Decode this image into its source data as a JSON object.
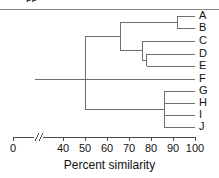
{
  "figure": {
    "clipped_caption_fragment": "pp",
    "axis_title": "Percent similarity",
    "axis_break_marker": "//",
    "line_color": "#6e6e6e",
    "text_color": "#111111",
    "background": "#ffffff"
  },
  "leaves": [
    {
      "label": "A",
      "y": 16,
      "merge_similarity": 92
    },
    {
      "label": "B",
      "y": 28,
      "merge_similarity": 92
    },
    {
      "label": "C",
      "y": 41,
      "merge_similarity": 76
    },
    {
      "label": "D",
      "y": 54,
      "merge_similarity": 78
    },
    {
      "label": "E",
      "y": 66,
      "merge_similarity": 78
    },
    {
      "label": "F",
      "y": 79,
      "merge_similarity": 50
    },
    {
      "label": "G",
      "y": 91,
      "merge_similarity": 86
    },
    {
      "label": "H",
      "y": 103,
      "merge_similarity": 86
    },
    {
      "label": "I",
      "y": 115,
      "merge_similarity": 86
    },
    {
      "label": "J",
      "y": 127,
      "merge_similarity": 86
    }
  ],
  "axis": {
    "ticks": [
      {
        "value": "0",
        "x": 13
      },
      {
        "value": "40",
        "x": 63
      },
      {
        "value": "50",
        "x": 85
      },
      {
        "value": "60",
        "x": 107
      },
      {
        "value": "70",
        "x": 129
      },
      {
        "value": "80",
        "x": 151
      },
      {
        "value": "90",
        "x": 173
      },
      {
        "value": "100",
        "x": 195
      }
    ],
    "break_x": 38,
    "axis_y": 137,
    "label_y": 143
  },
  "chart_data": {
    "type": "dendrogram",
    "title": "",
    "xlabel": "Percent similarity",
    "ylabel": "",
    "xlim": [
      0,
      100
    ],
    "axis_break": true,
    "axis_break_between": [
      0,
      40
    ],
    "tick_values": [
      0,
      40,
      50,
      60,
      70,
      80,
      90,
      100
    ],
    "grid": false,
    "legend": "none",
    "leaves": [
      "A",
      "B",
      "C",
      "D",
      "E",
      "F",
      "G",
      "H",
      "I",
      "J"
    ],
    "leaf_similarity": 100,
    "merges": [
      {
        "name": "A-B",
        "members": [
          "A",
          "B"
        ],
        "similarity": 92
      },
      {
        "name": "D-E",
        "members": [
          "D",
          "E"
        ],
        "similarity": 78
      },
      {
        "name": "C-DE",
        "members": [
          "C",
          "D",
          "E"
        ],
        "similarity": 76
      },
      {
        "name": "AB-CDE",
        "members": [
          "A",
          "B",
          "C",
          "D",
          "E"
        ],
        "similarity": 66
      },
      {
        "name": "G-H-I-J",
        "members": [
          "G",
          "H",
          "I",
          "J"
        ],
        "similarity": 86
      },
      {
        "name": "ABCDE-GHIJ",
        "members": [
          "A",
          "B",
          "C",
          "D",
          "E",
          "G",
          "H",
          "I",
          "J"
        ],
        "similarity": 50
      },
      {
        "name": "root-F",
        "members": [
          "A",
          "B",
          "C",
          "D",
          "E",
          "F",
          "G",
          "H",
          "I",
          "J"
        ],
        "similarity": 50
      }
    ]
  }
}
